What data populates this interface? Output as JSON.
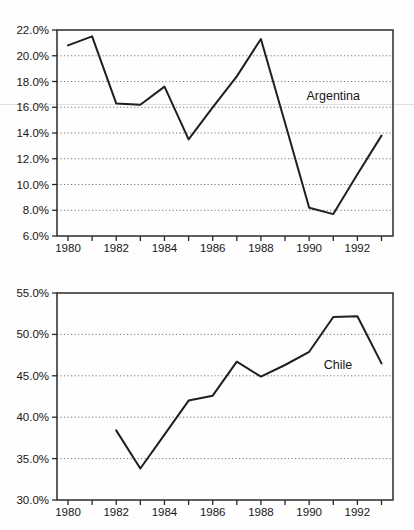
{
  "page": {
    "background": "#fefefe",
    "kind": "scanned statistical figure, two stacked line charts"
  },
  "colors": {
    "line": "#1f1f1f",
    "frame": "#2a2a2a",
    "grid": "#777777",
    "text": "#161616",
    "artifact": "#bdbdbd"
  },
  "chart_data": [
    {
      "type": "line",
      "name": "argentina",
      "title": "",
      "series_label": "Argentina",
      "x": [
        1980,
        1981,
        1982,
        1983,
        1984,
        1985,
        1986,
        1987,
        1988,
        1989,
        1990,
        1991,
        1992,
        1993
      ],
      "values": [
        20.8,
        21.5,
        16.3,
        16.2,
        17.6,
        13.5,
        16.0,
        18.4,
        21.3,
        14.8,
        8.2,
        7.7,
        10.8,
        13.8
      ],
      "ylabel": "",
      "xlabel": "",
      "ylim": [
        6.0,
        22.0
      ],
      "ytick_step": 2.0,
      "ytick_labels": [
        "22.0%",
        "20.0%",
        "18.0%",
        "16.0%",
        "14.0%",
        "12.0%",
        "10.0%",
        "8.0%",
        "6.0%"
      ],
      "xticks_all": [
        1980,
        1981,
        1982,
        1983,
        1984,
        1985,
        1986,
        1987,
        1988,
        1989,
        1990,
        1991,
        1992,
        1993
      ],
      "xtick_labeled_years": [
        1980,
        1982,
        1984,
        1986,
        1988,
        1990,
        1992
      ],
      "xtick_labels": [
        "1980",
        "1982",
        "1984",
        "1986",
        "1988",
        "1990",
        "1992"
      ],
      "grid": "horizontal-dotted",
      "legend_position": "inline-annotation",
      "annotation": {
        "text": "Argentina",
        "year": 1991.0,
        "value": 16.85
      }
    },
    {
      "type": "line",
      "name": "chile",
      "title": "",
      "series_label": "Chile",
      "x": [
        1982,
        1983,
        1984,
        1985,
        1986,
        1987,
        1988,
        1989,
        1990,
        1991,
        1992,
        1993
      ],
      "values": [
        38.4,
        33.8,
        37.9,
        42.0,
        42.6,
        46.7,
        44.9,
        46.3,
        47.9,
        52.1,
        52.2,
        46.5
      ],
      "ylabel": "",
      "xlabel": "",
      "ylim": [
        30.0,
        55.0
      ],
      "ytick_step": 5.0,
      "ytick_labels": [
        "55.0%",
        "50.0%",
        "45.0%",
        "40.0%",
        "35.0%",
        "30.0%"
      ],
      "xticks_all": [
        1980,
        1981,
        1982,
        1983,
        1984,
        1985,
        1986,
        1987,
        1988,
        1989,
        1990,
        1991,
        1992,
        1993
      ],
      "xtick_labeled_years": [
        1980,
        1982,
        1984,
        1986,
        1988,
        1990,
        1992
      ],
      "xtick_labels": [
        "1980",
        "1982",
        "1984",
        "1986",
        "1988",
        "1990",
        "1992"
      ],
      "grid": "horizontal-dotted",
      "legend_position": "inline-annotation",
      "annotation": {
        "text": "Chile",
        "year": 1991.2,
        "value": 46.35
      }
    }
  ]
}
